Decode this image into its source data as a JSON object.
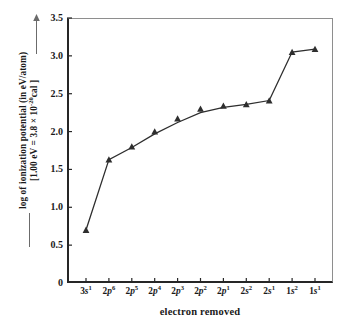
{
  "chart_data": {
    "type": "line",
    "title": "",
    "subtitle": "",
    "xlabel": "electron removed",
    "ylabel": "log of ionization potential (in eV/atom) [1.00 eV = 3.8 × 10⁻²⁰cal ]",
    "ylabel_line1": "log of ionization potential (in eV/atom)",
    "ylabel_line2": "[1.00 eV = 3.8 × 10",
    "ylabel_line2_sup": "-20",
    "ylabel_line2_end": "cal ]",
    "categories": [
      "3s1",
      "2p6",
      "2p5",
      "2p4",
      "2p3",
      "2p2",
      "2p1",
      "2s2",
      "2s1",
      "1s2",
      "1s1"
    ],
    "category_labels": [
      {
        "base": "3",
        "orbital": "s",
        "sup": "1"
      },
      {
        "base": "2",
        "orbital": "p",
        "sup": "6"
      },
      {
        "base": "2",
        "orbital": "p",
        "sup": "5"
      },
      {
        "base": "2",
        "orbital": "p",
        "sup": "4"
      },
      {
        "base": "2",
        "orbital": "p",
        "sup": "3"
      },
      {
        "base": "2",
        "orbital": "p",
        "sup": "2"
      },
      {
        "base": "2",
        "orbital": "p",
        "sup": "1"
      },
      {
        "base": "2",
        "orbital": "s",
        "sup": "2"
      },
      {
        "base": "2",
        "orbital": "s",
        "sup": "1"
      },
      {
        "base": "1",
        "orbital": "s",
        "sup": "2"
      },
      {
        "base": "1",
        "orbital": "s",
        "sup": "1"
      }
    ],
    "values": [
      0.7,
      1.63,
      1.79,
      1.97,
      2.12,
      2.25,
      2.32,
      2.36,
      2.41,
      3.05,
      3.09
    ],
    "marker_offsets": [
      0.0,
      0.0,
      0.01,
      0.03,
      0.05,
      0.05,
      0.02,
      0.0,
      0.0,
      0.0,
      0.0
    ],
    "ylim": [
      0,
      3.5
    ],
    "yticks": [
      0,
      0.5,
      1.0,
      1.5,
      2.0,
      2.5,
      3.0,
      3.5
    ],
    "ytick_labels": [
      "0",
      "0.5",
      "1.0",
      "1.5",
      "2.0",
      "2.5",
      "3.0",
      "3.5"
    ],
    "grid": false,
    "legend": "none",
    "marker": "triangle",
    "line_color": "#2e2e2e",
    "marker_color": "#2e2e2e",
    "axis_color": "#262626",
    "frame_color": "#8e8e8e",
    "background": "#ffffff"
  }
}
